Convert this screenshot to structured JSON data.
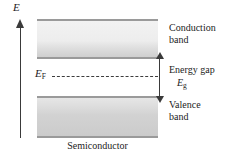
{
  "figure": {
    "background_color": "#ffffff"
  },
  "axis": {
    "label": "E",
    "name": "energy-axis",
    "direction": "up",
    "color": "#3a3a3a"
  },
  "bands": {
    "conduction": {
      "label_line1": "Conduction",
      "label_line2": "band",
      "fill_top_color": "#f2f2f2",
      "fill_bottom_color": "#cfcfcf",
      "edge_color": "#9a9a9a"
    },
    "valence": {
      "label_line1": "Valence",
      "label_line2": "band",
      "fill_top_color": "#e6e6e6",
      "fill_bottom_color": "#cbcbcb",
      "edge_color": "#9a9a9a"
    }
  },
  "fermi": {
    "symbol": "E",
    "subscript": "F",
    "line_style": "dashed",
    "line_color": "#3d3d3d"
  },
  "gap": {
    "label": "Energy gap",
    "symbol": "E",
    "subscript": "g",
    "arrow_color": "#3a3a3a"
  },
  "material": {
    "label": "Semiconductor"
  },
  "chart_data": {
    "type": "diagram",
    "ylabel": "E",
    "annotations": [
      "Conduction band",
      "Energy gap",
      "E_g",
      "E_F",
      "Valence band",
      "Semiconductor"
    ],
    "bands": [
      {
        "name": "Conduction band",
        "position": "upper",
        "shading": "light-gray gradient"
      },
      {
        "name": "Valence band",
        "position": "lower",
        "shading": "medium-gray gradient"
      }
    ],
    "levels": [
      {
        "name": "E_F",
        "description": "Fermi level, dashed line midway in the gap"
      }
    ]
  }
}
